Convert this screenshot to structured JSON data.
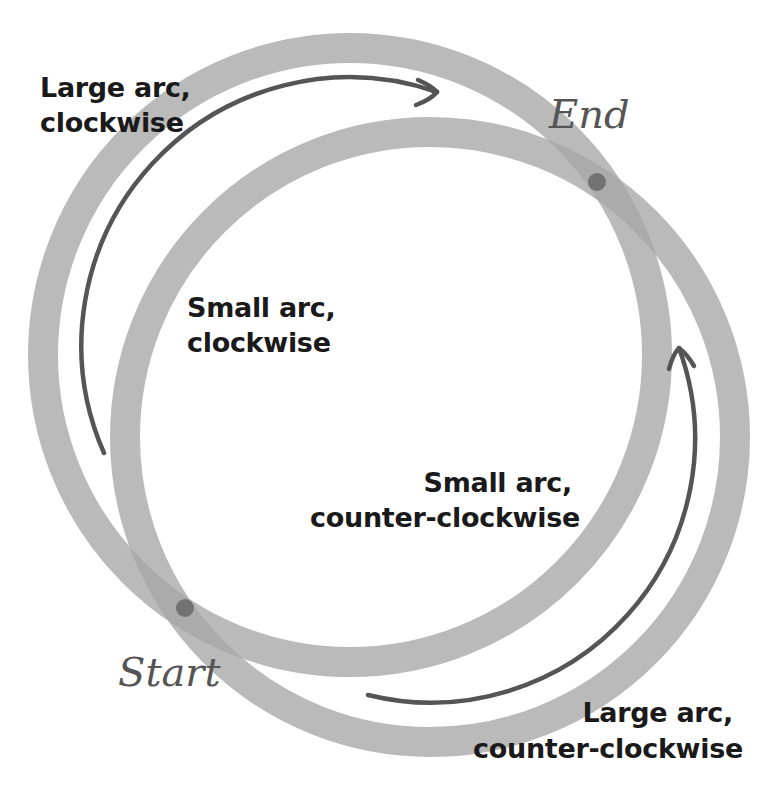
{
  "diagram": {
    "colors": {
      "ring": "#a6a6a6",
      "ring_opacity": 0.92,
      "arrow": "#555555",
      "point": "#5a5a5a",
      "label_text": "#1a1a1a",
      "point_label_text": "#555555",
      "background": "#ffffff"
    },
    "rings": [
      {
        "name": "ring-upper-left",
        "cx": 350,
        "cy": 355,
        "r": 307,
        "stroke_width": 30
      },
      {
        "name": "ring-lower-right",
        "cx": 430,
        "cy": 437,
        "r": 305,
        "stroke_width": 30
      }
    ],
    "points": {
      "start": {
        "label": "Start",
        "x": 185,
        "y": 608
      },
      "end": {
        "label": "End",
        "x": 597,
        "y": 182
      }
    },
    "labels": {
      "large_cw": {
        "line1": "Large arc,",
        "line2": "clockwise"
      },
      "small_cw": {
        "line1": "Small arc,",
        "line2": "clockwise"
      },
      "small_ccw": {
        "line1": "Small arc,",
        "line2": "counter-clockwise"
      },
      "large_ccw": {
        "line1": "Large arc,",
        "line2": "counter-clockwise"
      }
    },
    "arrows": [
      {
        "name": "large-arc-clockwise-arrow",
        "from": [
          104,
          453
        ],
        "to": [
          437,
          92
        ],
        "direction": "clockwise"
      },
      {
        "name": "large-arc-counter-clockwise-arrow",
        "from": [
          368,
          695
        ],
        "to": [
          679,
          348
        ],
        "direction": "counter-clockwise"
      }
    ]
  }
}
